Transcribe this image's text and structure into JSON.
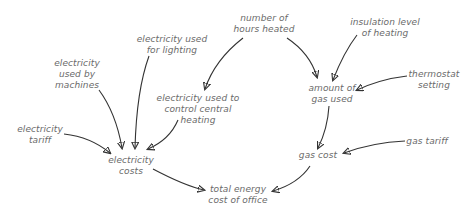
{
  "diagram": {
    "type": "influence-diagram",
    "nodes": {
      "hours_heated": {
        "line1": "number of",
        "line2": "hours heated"
      },
      "insulation": {
        "line1": "insulation level",
        "line2": "of heating"
      },
      "elec_lighting": {
        "line1": "electricity used",
        "line2": "for lighting"
      },
      "elec_machines": {
        "line1": "electricity",
        "line2": "used by",
        "line3": "machines"
      },
      "elec_heating": {
        "line1": "electricity used to",
        "line2": "control central",
        "line3": "heating"
      },
      "thermostat": {
        "line1": "thermostat",
        "line2": "setting"
      },
      "gas_used": {
        "line1": "amount of",
        "line2": "gas used"
      },
      "elec_tariff": {
        "line1": "electricity",
        "line2": "tariff"
      },
      "elec_costs": {
        "line1": "electricity",
        "line2": "costs"
      },
      "gas_cost": {
        "line1": "gas cost"
      },
      "gas_tariff": {
        "line1": "gas tariff"
      },
      "total": {
        "line1": "total energy",
        "line2": "cost of office"
      }
    },
    "edges": [
      {
        "from": "hours_heated",
        "to": "elec_heating"
      },
      {
        "from": "hours_heated",
        "to": "gas_used"
      },
      {
        "from": "insulation",
        "to": "gas_used"
      },
      {
        "from": "thermostat",
        "to": "gas_used"
      },
      {
        "from": "elec_lighting",
        "to": "elec_costs"
      },
      {
        "from": "elec_machines",
        "to": "elec_costs"
      },
      {
        "from": "elec_heating",
        "to": "elec_costs"
      },
      {
        "from": "elec_tariff",
        "to": "elec_costs"
      },
      {
        "from": "gas_used",
        "to": "gas_cost"
      },
      {
        "from": "gas_tariff",
        "to": "gas_cost"
      },
      {
        "from": "elec_costs",
        "to": "total"
      },
      {
        "from": "gas_cost",
        "to": "total"
      }
    ],
    "colors": {
      "text": "#6a6a6a",
      "arrow": "#333333",
      "background": "#ffffff"
    }
  }
}
